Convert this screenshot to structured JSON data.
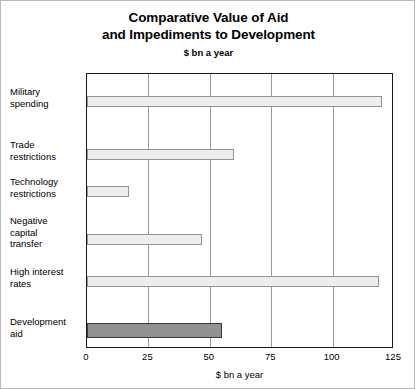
{
  "chart_data": {
    "type": "bar",
    "orientation": "horizontal",
    "title": "Comparative Value of Aid and Impediments to Development",
    "title_lines": [
      "Comparative Value of Aid",
      "and Impediments to Development"
    ],
    "subtitle": "$ bn a year",
    "xlabel": "$ bn a year",
    "ylabel": "",
    "xlim": [
      0,
      125
    ],
    "xticks": [
      0,
      25,
      50,
      75,
      100,
      125
    ],
    "xtick_labels": [
      "0",
      "25",
      "50",
      "75",
      "100",
      "125"
    ],
    "grid": "vertical",
    "legend": "none",
    "categories": [
      "Military spending",
      "Trade restrictions",
      "Technology restrictions",
      "Negative capital transfer",
      "High interest rates",
      "Development aid"
    ],
    "category_label_lines": [
      [
        "Military",
        "spending"
      ],
      [
        "Trade",
        "restrictions"
      ],
      [
        "Technology",
        "restrictions"
      ],
      [
        "Negative",
        "capital",
        "transfer"
      ],
      [
        "High interest",
        "rates"
      ],
      [
        "Development",
        "aid"
      ]
    ],
    "values": [
      120,
      60,
      17,
      47,
      119,
      55
    ],
    "bar_colors": [
      "#ededed",
      "#ededed",
      "#ededed",
      "#ededed",
      "#ededed",
      "#919191"
    ],
    "highlight_category": "Development aid",
    "colors": {
      "bar_light_fill": "#ededed",
      "bar_light_border": "#949494",
      "bar_dark_fill": "#919191",
      "bar_dark_border": "#3a3a3a",
      "axis": "#1a1a1a",
      "gridline": "#9a9a9a",
      "text": "#000000",
      "background": "#ffffff"
    }
  }
}
